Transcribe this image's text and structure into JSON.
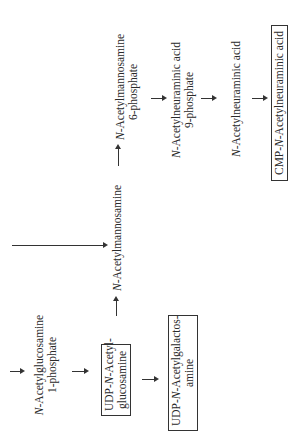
{
  "diagram": {
    "orientation": "rotated 90 degrees counterclockwise",
    "nodes": {
      "glcnac_1p": {
        "prefix": "N",
        "line1": "-Acetylglucosamine",
        "line2": "1-phosphate"
      },
      "udp_glcnac": {
        "line1_pre": "UDP-",
        "prefix": "N",
        "line1": "-Acetyl-",
        "line2": "glucosamine",
        "boxed": true
      },
      "udp_galnac": {
        "line1_pre": "UDP-",
        "prefix": "N",
        "line1": "-Acetylgalactos-",
        "line2": "amine",
        "boxed": true
      },
      "mannac": {
        "prefix": "N",
        "line1": "-Acetylmannosamine"
      },
      "mannac_6p": {
        "prefix": "N",
        "line1": "-Acetylmannosamine",
        "line2": "6-phosphate"
      },
      "neuac_9p": {
        "prefix": "N",
        "line1": "-Acetylneuraminic acid",
        "line2": "9-phosphate"
      },
      "neuac": {
        "prefix": "N",
        "line1": "-Acetylneuraminic acid"
      },
      "cmp_neuac": {
        "line1_pre": "CMP-",
        "prefix": "N",
        "line1": "-Acetylneuraminic acid",
        "boxed": true
      }
    },
    "edges": [
      {
        "from": "input",
        "to": "glcnac_1p"
      },
      {
        "from": "glcnac_1p",
        "to": "udp_glcnac"
      },
      {
        "from": "udp_glcnac",
        "to": "mannac"
      },
      {
        "from": "udp_glcnac",
        "to": "udp_galnac"
      },
      {
        "from": "input_long",
        "to": "mannac"
      },
      {
        "from": "mannac",
        "to": "mannac_6p"
      },
      {
        "from": "mannac_6p",
        "to": "neuac_9p"
      },
      {
        "from": "neuac_9p",
        "to": "neuac"
      },
      {
        "from": "neuac",
        "to": "cmp_neuac"
      }
    ],
    "colors": {
      "ink": "#2a2a2a",
      "background": "#ffffff"
    }
  }
}
